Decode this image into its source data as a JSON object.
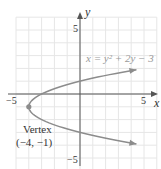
{
  "chart_data": {
    "type": "line",
    "title": "",
    "equation_label": "x = y² + 2y − 3",
    "xlabel": "x",
    "ylabel": "y",
    "xlim": [
      -5,
      6
    ],
    "ylim": [
      -6,
      6
    ],
    "grid": true,
    "x_ticks": [
      {
        "value": -5,
        "label": "−5"
      },
      {
        "value": 5,
        "label": "5"
      }
    ],
    "y_ticks": [
      {
        "value": 5,
        "label": "5"
      },
      {
        "value": -5,
        "label": "−5"
      }
    ],
    "series": [
      {
        "name": "x = y^2 + 2y - 3",
        "color": "#8c8c8c",
        "y_range": [
          -3.9,
          1.9
        ],
        "points": [
          {
            "x": 4.31,
            "y": -3.9
          },
          {
            "x": 0.0,
            "y": -3.0
          },
          {
            "x": -3.0,
            "y": -2.0
          },
          {
            "x": -4.0,
            "y": -1.0
          },
          {
            "x": -3.0,
            "y": 0.0
          },
          {
            "x": 0.0,
            "y": 1.0
          },
          {
            "x": 4.41,
            "y": 1.9
          }
        ]
      }
    ],
    "annotations": [
      {
        "text": "Vertex",
        "x": -4,
        "y": -1
      },
      {
        "text": "(−4, −1)",
        "x": -4,
        "y": -1
      }
    ],
    "vertex": {
      "x": -4,
      "y": -1
    }
  },
  "labels": {
    "x_axis": "x",
    "y_axis": "y",
    "x_tick_neg5": "−5",
    "x_tick_5": "5",
    "y_tick_5": "5",
    "y_tick_neg5": "−5",
    "equation": "x = y² + 2y − 3",
    "vertex_title": "Vertex",
    "vertex_coords": "(−4, −1)"
  },
  "colors": {
    "axis": "#555555",
    "grid": "#e6e6e6",
    "curve": "#8c8c8c",
    "text": "#333333",
    "equation": "#9a9a9a"
  }
}
